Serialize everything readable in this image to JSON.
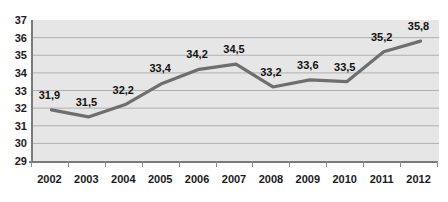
{
  "chart_data": {
    "type": "line",
    "title": "",
    "subtitle": "",
    "xlabel": "",
    "ylabel": "",
    "categories": [
      "2002",
      "2003",
      "2004",
      "2005",
      "2006",
      "2007",
      "2008",
      "2009",
      "2010",
      "2011",
      "2012"
    ],
    "values": [
      31.9,
      31.5,
      32.2,
      33.4,
      34.2,
      34.5,
      33.2,
      33.6,
      33.5,
      35.2,
      35.8
    ],
    "point_labels": [
      "31,9",
      "31,5",
      "32,2",
      "33,4",
      "34,2",
      "34,5",
      "33,2",
      "33,6",
      "33,5",
      "35,2",
      "35,8"
    ],
    "ylim": [
      29,
      37
    ],
    "y_ticks": [
      29,
      30,
      31,
      32,
      33,
      34,
      35,
      36,
      37
    ],
    "y_tick_labels": [
      "29",
      "30",
      "31",
      "32",
      "33",
      "34",
      "35",
      "36",
      "37"
    ],
    "grid": true,
    "grid_axis": "y",
    "legend": false,
    "legend_position": "none",
    "decimal_separator": ",",
    "series": [
      {
        "name": "",
        "values": [
          31.9,
          31.5,
          32.2,
          33.4,
          34.2,
          34.5,
          33.2,
          33.6,
          33.5,
          35.2,
          35.8
        ]
      }
    ],
    "colors": {
      "line": "#6e6e6e",
      "plot_background": "#e6e6e6",
      "gridline": "#b0b0b0",
      "axis": "#7a7a7a",
      "text": "#1a1a1a"
    }
  }
}
